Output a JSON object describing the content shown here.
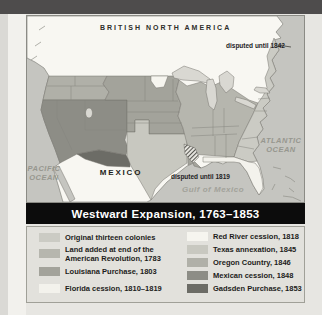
{
  "window": {
    "top_bar_color": "#4e4c4c",
    "page_bg": "#e7e6e2"
  },
  "title": {
    "text": "Westward Expansion, 1763–1853",
    "bar_color": "#0c0c0c",
    "text_color": "#ffffff"
  },
  "map": {
    "labels": {
      "british_north_america": "BRITISH NORTH AMERICA",
      "mexico": "MEXICO",
      "pacific_ocean": "PACIFIC\nOCEAN",
      "atlantic_ocean": "ATLANTIC\nOCEAN",
      "gulf_of_mexico": "Gulf of Mexico",
      "disputed_1842": "disputed until 1842",
      "disputed_1819": "disputed until 1819"
    },
    "colors": {
      "ocean": "#c5c5c0",
      "foreign_land": "#f8f7f2",
      "lakes": "#d9d8d2",
      "state_line": "#85857f",
      "coast_line": "#76756f"
    }
  },
  "legend": {
    "left_column": [
      {
        "label": "Original thirteen colonies",
        "color": "#cbcbc4"
      },
      {
        "label": "Land added at end of the American Revolution, 1783",
        "color": "#b6b6ae"
      },
      {
        "label": "Louisiana Purchase, 1803",
        "color": "#a3a39b"
      },
      {
        "label": "Florida cession, 1810–1819",
        "color": "#f3f2ec"
      }
    ],
    "right_column": [
      {
        "label": "Red River cession, 1818",
        "color": "#f6f5ef"
      },
      {
        "label": "Texas annexation, 1845",
        "color": "#c8c8c0"
      },
      {
        "label": "Oregon Country, 1846",
        "color": "#b0b0a8"
      },
      {
        "label": "Mexican cession, 1848",
        "color": "#8d8d86"
      },
      {
        "label": "Gadsden Purchase, 1853",
        "color": "#6c6c66"
      }
    ]
  }
}
